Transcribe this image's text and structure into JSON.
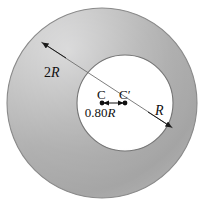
{
  "figure": {
    "labels": {
      "outer_radius": "2R",
      "inner_radius": "R",
      "center_outer": "C",
      "center_inner": "C′",
      "center_offset": "0.80R",
      "offset_number": "0.80",
      "offset_symbol": "R",
      "outer_number": "2",
      "outer_symbol": "R",
      "inner_symbol": "R"
    },
    "colors": {
      "shading_light": "#e8e8e8",
      "shading_mid": "#b5b5b5",
      "shading_dark": "#9a9a9a",
      "hole_fill": "#ffffff",
      "outline": "#7d7d7d",
      "ink": "#111111"
    },
    "geometry": {
      "outer_center_x": 102,
      "outer_center_y": 103,
      "outer_radius_px": 95,
      "inner_center_x": 125,
      "inner_center_y": 103,
      "inner_radius_px": 48,
      "offset_px": 23
    }
  }
}
